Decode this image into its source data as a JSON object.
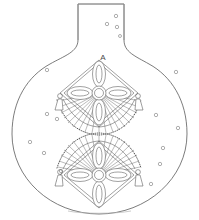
{
  "figure": {
    "label": "A",
    "label_position": {
      "x": 103,
      "y": 60
    }
  },
  "vessel": {
    "name": "globular-flask",
    "colors": {
      "outline": "#5a5a5a",
      "motif": "#555555",
      "bead": "#3a3a3a",
      "dot": "#8d8d8d",
      "background": "#ffffff"
    },
    "neck": {
      "top_y": 3,
      "left_x": 78,
      "right_x": 124,
      "bottom_y": 44
    },
    "body": {
      "center_x": 99,
      "widest_y": 140,
      "left_x": 12,
      "right_x": 187,
      "bottom_y": 214
    }
  },
  "medallions": [
    {
      "name": "upper-rosette",
      "center_x": 99,
      "center_y": 93,
      "orientation": "fan-below",
      "petal_count": 4,
      "ray_count": 19,
      "tassels": 2
    },
    {
      "name": "lower-rosette",
      "center_x": 99,
      "center_y": 175,
      "orientation": "fan-above",
      "petal_count": 4,
      "ray_count": 19,
      "tassels": 2
    }
  ],
  "dots": {
    "name": "scattered-circles",
    "count": 19,
    "radius": 1.7,
    "positions": [
      [
        116,
        16
      ],
      [
        107,
        24
      ],
      [
        117,
        27
      ],
      [
        120,
        36
      ],
      [
        47,
        70
      ],
      [
        176,
        72
      ],
      [
        47,
        114
      ],
      [
        57,
        119
      ],
      [
        30,
        142
      ],
      [
        44,
        153
      ],
      [
        156,
        115
      ],
      [
        163,
        148
      ],
      [
        160,
        164
      ],
      [
        61,
        171
      ],
      [
        58,
        182
      ],
      [
        151,
        184
      ],
      [
        135,
        40
      ],
      [
        25,
        96
      ],
      [
        178,
        128
      ]
    ]
  }
}
